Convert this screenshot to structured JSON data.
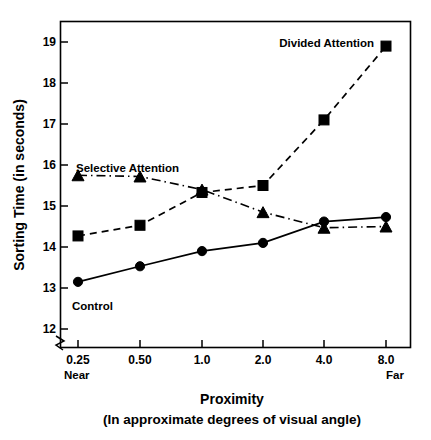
{
  "chart_data": {
    "type": "line",
    "title": "",
    "xlabel": "Proximity",
    "xlabel_sub": "(In approximate degrees of visual angle)",
    "ylabel": "Sorting Time (in seconds)",
    "categories": [
      "0.25",
      "0.50",
      "1.0",
      "2.0",
      "4.0",
      "8.0"
    ],
    "x_endpoint_left": "Near",
    "x_endpoint_right": "Far",
    "ylim": [
      12,
      19
    ],
    "yticks": [
      "12",
      "13",
      "14",
      "15",
      "16",
      "17",
      "18",
      "19"
    ],
    "ytick_values": [
      12,
      13,
      14,
      15,
      16,
      17,
      18,
      19
    ],
    "grid": false,
    "axis_break": true,
    "legend_position": "inline-annotations",
    "series": [
      {
        "name": "Control",
        "marker": "circle",
        "linestyle": "solid",
        "values": [
          13.15,
          13.53,
          13.9,
          14.1,
          14.62,
          14.73
        ]
      },
      {
        "name": "Divided Attention",
        "marker": "square",
        "linestyle": "dashed",
        "values": [
          14.27,
          14.53,
          15.33,
          15.5,
          17.1,
          18.9
        ]
      },
      {
        "name": "Selective Attention",
        "marker": "triangle",
        "linestyle": "dashdot",
        "values": [
          15.75,
          15.72,
          15.4,
          14.85,
          14.47,
          14.5
        ]
      }
    ],
    "annotations": [
      {
        "text": "Divided Attention",
        "series": "Divided Attention"
      },
      {
        "text": "Selective Attention",
        "series": "Selective Attention"
      },
      {
        "text": "Control",
        "series": "Control"
      }
    ],
    "colors": {
      "ink": "#000000",
      "background": "#ffffff"
    }
  }
}
